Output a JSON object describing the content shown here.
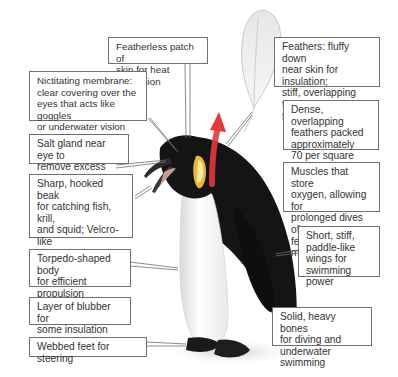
{
  "diagram": {
    "callouts": [
      {
        "id": "featherless-patch",
        "text": "Featherless patch of\nskin for heat dispersion"
      },
      {
        "id": "feathers",
        "text": "Feathers: fluffy down\nnear skin for insulation;\nstiff, overlapping tips\nfor waterproofing"
      },
      {
        "id": "nictitating-membrane",
        "text": "Nictitating membrane:\nclear covering over the\neyes that acts like goggles\nor underwater vision"
      },
      {
        "id": "dense-feathers",
        "text": "Dense, overlapping\nfeathers packed\napproximately\n70 per square inch"
      },
      {
        "id": "salt-gland",
        "text": "Salt gland near eye to\nremove excess salt"
      },
      {
        "id": "beak",
        "text": "Sharp, hooked beak\nfor catching fish, krill,\nand squid; Velcro-like\ntongue to hold on to\ntheir slippery food"
      },
      {
        "id": "muscles",
        "text": "Muscles that store\noxygen, allowing for\nprolonged dives of a\nfew minutes or more"
      },
      {
        "id": "wings",
        "text": "Short, stiff,\npaddle-like\nwings for\nswimming power"
      },
      {
        "id": "torpedo-body",
        "text": "Torpedo-shaped body\nfor efficient propulsion\nunder water"
      },
      {
        "id": "blubber",
        "text": "Layer of blubber for\nsome insulation"
      },
      {
        "id": "bones",
        "text": "Solid, heavy bones\nfor diving and\nunderwater swimming"
      },
      {
        "id": "webbed-feet",
        "text": "Webbed feet for steering"
      }
    ]
  }
}
